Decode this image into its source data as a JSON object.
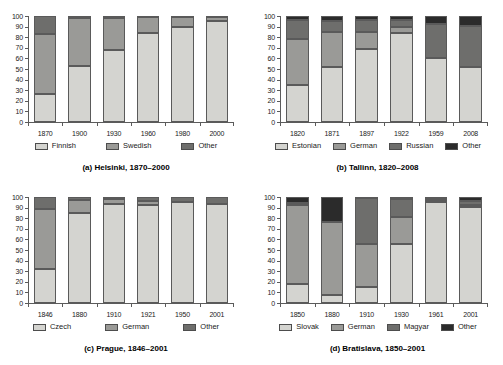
{
  "figure": {
    "background": "#ffffff",
    "panel_count": 4
  },
  "palette": {
    "light": "#d4d4d0",
    "mid": "#9a9a97",
    "dark": "#6e6e6c",
    "black": "#2b2b2b",
    "axis": "#5b5b5b",
    "text": "#1a1a1a"
  },
  "chart_data": [
    {
      "type": "bar",
      "stacked": true,
      "percent": true,
      "title": "(a) Helsinki, 1870–2000",
      "panel_id": "a",
      "xlabel": "",
      "ylabel": "",
      "ylim": [
        0,
        100
      ],
      "yticks": [
        0,
        10,
        20,
        30,
        40,
        50,
        60,
        70,
        80,
        90,
        100
      ],
      "grid": false,
      "legend_position": "bottom",
      "categories": [
        "1870",
        "1900",
        "1930",
        "1960",
        "1980",
        "2000"
      ],
      "series": [
        {
          "name": "Finnish",
          "color": "#d4d4d0",
          "values": [
            26,
            53,
            68,
            84,
            90,
            95
          ]
        },
        {
          "name": "Swedish",
          "color": "#9a9a97",
          "values": [
            57,
            45,
            30,
            15,
            9,
            4
          ]
        },
        {
          "name": "Other",
          "color": "#6e6e6c",
          "values": [
            17,
            2,
            2,
            1,
            1,
            1
          ]
        }
      ]
    },
    {
      "type": "bar",
      "stacked": true,
      "percent": true,
      "title": "(b) Tallinn, 1820–2008",
      "panel_id": "b",
      "xlabel": "",
      "ylabel": "",
      "ylim": [
        0,
        100
      ],
      "yticks": [
        0,
        10,
        20,
        30,
        40,
        50,
        60,
        70,
        80,
        90,
        100
      ],
      "grid": false,
      "legend_position": "bottom",
      "categories": [
        "1820",
        "1871",
        "1897",
        "1922",
        "1959",
        "2008"
      ],
      "series": [
        {
          "name": "Estonian",
          "color": "#d4d4d0",
          "values": [
            35,
            52,
            69,
            84,
            60,
            52
          ]
        },
        {
          "name": "German",
          "color": "#9a9a97",
          "values": [
            43,
            33,
            16,
            6,
            0,
            0
          ]
        },
        {
          "name": "Russian",
          "color": "#6e6e6c",
          "values": [
            18,
            10,
            11,
            6,
            32,
            39
          ]
        },
        {
          "name": "Other",
          "color": "#2b2b2b",
          "values": [
            4,
            5,
            4,
            4,
            8,
            9
          ]
        }
      ]
    },
    {
      "type": "bar",
      "stacked": true,
      "percent": true,
      "title": "(c) Prague, 1846–2001",
      "panel_id": "c",
      "xlabel": "",
      "ylabel": "",
      "ylim": [
        0,
        100
      ],
      "yticks": [
        0,
        10,
        20,
        30,
        40,
        50,
        60,
        70,
        80,
        90,
        100
      ],
      "grid": false,
      "legend_position": "bottom",
      "categories": [
        "1846",
        "1880",
        "1910",
        "1921",
        "1950",
        "2001"
      ],
      "series": [
        {
          "name": "Czech",
          "color": "#d4d4d0",
          "values": [
            32,
            85,
            93,
            92,
            95,
            93
          ]
        },
        {
          "name": "German",
          "color": "#9a9a97",
          "values": [
            57,
            12,
            5,
            4,
            0,
            0
          ]
        },
        {
          "name": "Other",
          "color": "#6e6e6c",
          "values": [
            11,
            3,
            2,
            4,
            5,
            7
          ]
        }
      ]
    },
    {
      "type": "bar",
      "stacked": true,
      "percent": true,
      "title": "(d) Bratislava, 1850–2001",
      "panel_id": "d",
      "xlabel": "",
      "ylabel": "",
      "ylim": [
        0,
        100
      ],
      "yticks": [
        0,
        10,
        20,
        30,
        40,
        50,
        60,
        70,
        80,
        90,
        100
      ],
      "grid": false,
      "legend_position": "bottom",
      "categories": [
        "1850",
        "1880",
        "1910",
        "1930",
        "1961",
        "2001"
      ],
      "series": [
        {
          "name": "Slovak",
          "color": "#d4d4d0",
          "values": [
            18,
            8,
            15,
            56,
            95,
            91
          ]
        },
        {
          "name": "German",
          "color": "#9a9a97",
          "values": [
            74,
            68,
            41,
            25,
            2,
            1
          ]
        },
        {
          "name": "Magyar",
          "color": "#6e6e6c",
          "values": [
            2,
            0,
            43,
            17,
            2,
            4
          ]
        },
        {
          "name": "Other",
          "color": "#2b2b2b",
          "values": [
            6,
            24,
            1,
            2,
            1,
            4
          ]
        }
      ]
    }
  ]
}
